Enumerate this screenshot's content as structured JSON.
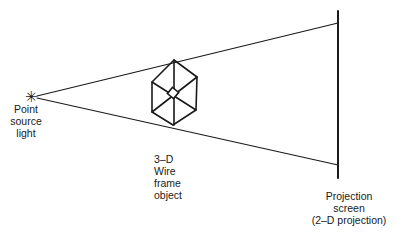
{
  "diagram": {
    "type": "perspective-projection-illustration",
    "colors": {
      "line": "#1a1a1a",
      "background": "#ffffff"
    },
    "nodes": [
      {
        "id": "source",
        "label_lines": [
          "Point",
          "source",
          "light"
        ],
        "icon": "asterisk-icon",
        "glyph": "✳"
      },
      {
        "id": "object",
        "label_lines": [
          "3–D",
          "Wire",
          "frame",
          "object"
        ],
        "shape": "wireframe-cube"
      },
      {
        "id": "screen",
        "label_lines": [
          "Projection",
          "screen",
          "(2–D projection)"
        ],
        "shape": "vertical-line"
      }
    ],
    "edges": [
      {
        "from": "source",
        "to": "screen",
        "kind": "upper-ray"
      },
      {
        "from": "source",
        "to": "screen",
        "kind": "lower-ray"
      }
    ]
  }
}
